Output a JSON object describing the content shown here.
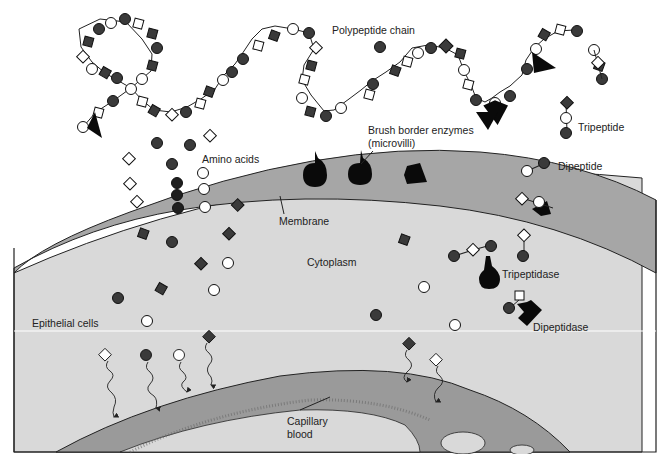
{
  "labels": {
    "polypeptide_chain": "Polypeptide chain",
    "brush_border_line1": "Brush border enzymes",
    "brush_border_line2": "(microvilli)",
    "tripeptide": "Tripeptide",
    "dipeptide": "Dipeptide",
    "amino_acids": "Amino acids",
    "membrane": "Membrane",
    "cytoplasm": "Cytoplasm",
    "tripeptidase": "Tripeptidase",
    "dipeptidase": "Dipeptidase",
    "epithelial_cells": "Epithelial cells",
    "capillary_line1": "Capillary",
    "capillary_line2": "blood"
  },
  "colors": {
    "background": "#ffffff",
    "cytoplasm": "#d9d9d9",
    "membrane_band": "#a6a6a6",
    "capillary_band": "#9a9a9a",
    "dark_residue": "#3a3a3a",
    "enzyme": "#0a0a0a",
    "outline": "#1a1a1a"
  },
  "legend_shapes": {
    "dark-circle": "amino acid type A",
    "white-circle": "amino acid type B",
    "dark-diamond": "amino acid type C",
    "white-diamond": "amino acid type D"
  }
}
